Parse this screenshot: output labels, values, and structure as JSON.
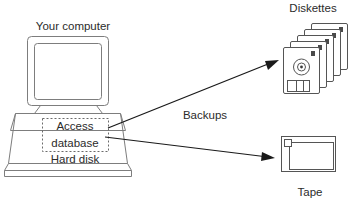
{
  "diagram": {
    "labels": {
      "computer": "Your computer",
      "access_database": "Access\ndatabase",
      "access_database_line1": "Access",
      "access_database_line2": "database",
      "hard_disk": "Hard disk",
      "backups": "Backups",
      "diskettes": "Diskettes",
      "tape": "Tape"
    },
    "nodes": [
      {
        "id": "computer",
        "label": "Your computer",
        "kind": "desktop-computer"
      },
      {
        "id": "hard-disk",
        "label": "Hard disk",
        "kind": "storage"
      },
      {
        "id": "access-database",
        "label": "Access database",
        "kind": "dashed-region"
      },
      {
        "id": "diskettes",
        "label": "Diskettes",
        "kind": "floppy-disk-stack",
        "count": 5
      },
      {
        "id": "tape",
        "label": "Tape",
        "kind": "tape-cartridge"
      }
    ],
    "edges": [
      {
        "from": "access-database",
        "to": "diskettes",
        "label": "Backups"
      },
      {
        "from": "access-database",
        "to": "tape",
        "label": "Backups"
      }
    ],
    "colors": {
      "background": "#ffffff",
      "line": "#7d7d7d",
      "line_dark": "#404040",
      "arrow": "#1a1a1a",
      "text": "#2b2b2b",
      "dashed": "#6b6b6b"
    }
  }
}
